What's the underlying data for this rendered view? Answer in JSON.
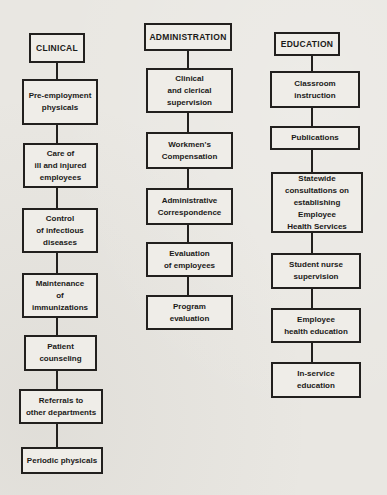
{
  "diagram_title": "Employee Health Services functions flowchart",
  "colors": {
    "page_background": "#e9e7e2",
    "box_fill": "#efede8",
    "line_and_border": "#22201e",
    "text": "#1b1a18"
  },
  "columns": [
    {
      "header": "CLINICAL",
      "boxes": [
        "Pre-employment\nphysicals",
        "Care of\nill and injured\nemployees",
        "Control\nof infectious\ndiseases",
        "Maintenance\nof\nimmunizations",
        "Patient\ncounseling",
        "Referrals to\nother departments",
        "Periodic physicals"
      ]
    },
    {
      "header": "ADMINISTRATION",
      "boxes": [
        "Clinical\nand clerical\nsupervision",
        "Workmen's\nCompensation",
        "Administrative\nCorrespondence",
        "Evaluation\nof employees",
        "Program\nevaluation"
      ]
    },
    {
      "header": "EDUCATION",
      "boxes": [
        "Classroom\ninstruction",
        "Publications",
        "Statewide\nconsultations on\nestablishing\nEmployee\nHealth Services",
        "Student nurse\nsupervision",
        "Employee\nhealth education",
        "In-service\neducation"
      ]
    }
  ]
}
